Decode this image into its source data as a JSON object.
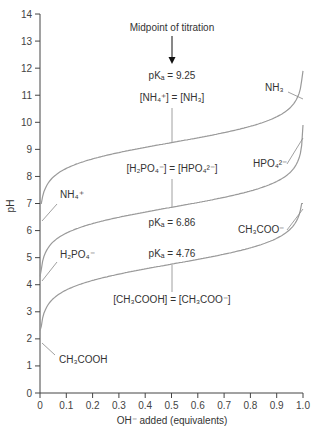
{
  "chart_data": {
    "type": "line",
    "title": "",
    "xlabel": "OH⁻ added (equivalents)",
    "ylabel": "pH",
    "xlim": [
      0,
      1.0
    ],
    "ylim": [
      0,
      14
    ],
    "grid": false,
    "x_ticks": [
      "0",
      "0.1",
      "0.2",
      "0.3",
      "0.4",
      "0.5",
      "0.6",
      "0.7",
      "0.8",
      "0.9",
      "1.0"
    ],
    "y_ticks": [
      "0",
      "1",
      "2",
      "3",
      "4",
      "5",
      "6",
      "7",
      "8",
      "9",
      "10",
      "11",
      "12",
      "13",
      "14"
    ],
    "series": [
      {
        "name": "NH4+ / NH3",
        "pKa": 9.25,
        "start_label": "NH₄⁺",
        "end_label": "NH₃",
        "x": [
          0.02,
          0.1,
          0.2,
          0.3,
          0.4,
          0.5,
          0.6,
          0.7,
          0.8,
          0.9,
          0.98
        ],
        "values": [
          7.0,
          8.3,
          8.65,
          8.88,
          9.07,
          9.25,
          9.43,
          9.62,
          9.85,
          10.2,
          11.9
        ]
      },
      {
        "name": "H2PO4- / HPO4 2-",
        "pKa": 6.86,
        "start_label": "H₂PO₄⁻",
        "end_label": "HPO₄²⁻",
        "x": [
          0.02,
          0.1,
          0.2,
          0.3,
          0.4,
          0.5,
          0.6,
          0.7,
          0.8,
          0.9,
          0.98
        ],
        "values": [
          4.3,
          5.9,
          6.26,
          6.49,
          6.68,
          6.86,
          7.04,
          7.23,
          7.46,
          7.81,
          9.9
        ]
      },
      {
        "name": "CH3COOH / CH3COO-",
        "pKa": 4.76,
        "start_label": "CH₃COOH",
        "end_label": "CH₃COO⁻",
        "x": [
          0.02,
          0.1,
          0.2,
          0.3,
          0.4,
          0.5,
          0.6,
          0.7,
          0.8,
          0.9,
          0.98
        ],
        "values": [
          2.3,
          3.8,
          4.16,
          4.39,
          4.58,
          4.76,
          4.94,
          5.13,
          5.36,
          5.71,
          7.0
        ]
      }
    ],
    "annotations": {
      "midpoint": "Midpoint of titration",
      "pka_nh3": "pKₐ = 9.25",
      "eq_nh3": "[NH₄⁺] = [NH₃]",
      "eq_phos": "[H₂PO₄⁻] = [HPO₄²⁻]",
      "pka_phos": "pKₐ = 6.86",
      "pka_acet": "pKₐ = 4.76",
      "eq_acet": "[CH₃COOH] = [CH₃COO⁻]"
    }
  }
}
